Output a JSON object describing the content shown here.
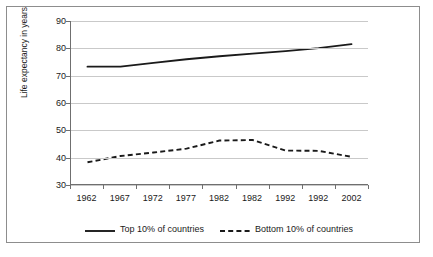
{
  "figure": {
    "background_color": "#ffffff",
    "frame_color": "#8d8d8d",
    "axis_color": "#6f6f6f",
    "grid_color": "#c9c9c9"
  },
  "axes": {
    "y_title": "Life expectancy in years",
    "y_ticks": [
      30,
      40,
      50,
      60,
      70,
      80,
      90
    ],
    "x_ticks": [
      "1962",
      "1967",
      "1972",
      "1977",
      "1982",
      "1982",
      "1992",
      "1992",
      "2002"
    ]
  },
  "legend": {
    "entries": [
      {
        "label": "Top 10% of countries",
        "style": "solid",
        "color": "#1a1a1a"
      },
      {
        "label": "Bottom 10% of countries",
        "style": "dashed",
        "color": "#1a1a1a"
      }
    ]
  },
  "chart_data": {
    "type": "line",
    "title": "",
    "subtitle": "",
    "xlabel": "",
    "ylabel": "Life expectancy in years",
    "categories": [
      "1962",
      "1967",
      "1972",
      "1977",
      "1982",
      "1982",
      "1992",
      "1992",
      "2002"
    ],
    "ylim": [
      30,
      90
    ],
    "ytick_step": 10,
    "grid": true,
    "legend_position": "bottom",
    "series": [
      {
        "name": "Top 10% of countries",
        "style": "solid",
        "color": "#1a1a1a",
        "values": [
          73.2,
          73.2,
          74.6,
          75.9,
          77.0,
          78.0,
          78.9,
          80.0,
          81.5
        ]
      },
      {
        "name": "Bottom 10% of countries",
        "style": "dashed",
        "color": "#1a1a1a",
        "values": [
          38.0,
          40.3,
          41.6,
          43.0,
          46.0,
          46.2,
          42.3,
          42.2,
          40.0
        ]
      }
    ]
  }
}
